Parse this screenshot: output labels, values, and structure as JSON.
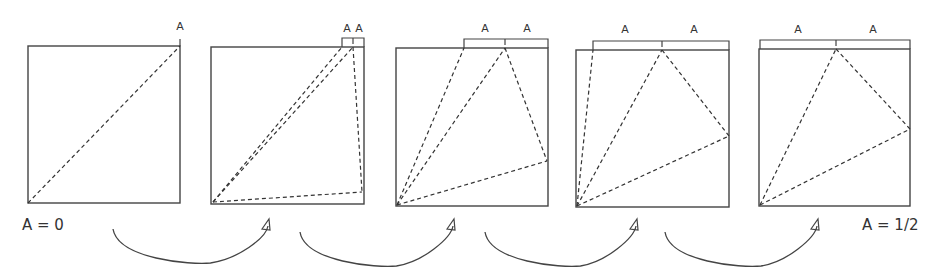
{
  "diagram": {
    "stroke_color": "#444444",
    "dash_color": "#333333",
    "labels": {
      "start": "A = 0",
      "end": "A = 1/2",
      "segment": "A"
    },
    "panels": [
      {
        "box": [
          28,
          46,
          180,
          203
        ],
        "brackets": [],
        "tick_labels": [
          {
            "x": 180,
            "y": 20,
            "text": "A"
          }
        ],
        "dashed_lines": [
          [
            [
              28,
              203
            ],
            [
              180,
              46
            ]
          ]
        ]
      },
      {
        "box": [
          211,
          47,
          364,
          204
        ],
        "brackets": [
          [
            342,
            353,
            364
          ]
        ],
        "tick_labels": [
          {
            "x": 347,
            "y": 22,
            "text": "A"
          },
          {
            "x": 359,
            "y": 22,
            "text": "A"
          }
        ],
        "dashed_lines": [
          [
            [
              213,
              202
            ],
            [
              342,
              47
            ]
          ],
          [
            [
              213,
              202
            ],
            [
              353,
              47
            ]
          ],
          [
            [
              353,
              47
            ],
            [
              362,
              192
            ]
          ],
          [
            [
              213,
              202
            ],
            [
              362,
              192
            ]
          ]
        ]
      },
      {
        "box": [
          396,
          48,
          548,
          206
        ],
        "brackets": [
          [
            464,
            505,
            548
          ]
        ],
        "tick_labels": [
          {
            "x": 485,
            "y": 22,
            "text": "A"
          },
          {
            "x": 527,
            "y": 22,
            "text": "A"
          }
        ],
        "dashed_lines": [
          [
            [
              397,
              205
            ],
            [
              464,
              48
            ]
          ],
          [
            [
              397,
              205
            ],
            [
              505,
              48
            ]
          ],
          [
            [
              505,
              48
            ],
            [
              547,
              161
            ]
          ],
          [
            [
              397,
              205
            ],
            [
              547,
              161
            ]
          ]
        ]
      },
      {
        "box": [
          576,
          50,
          729,
          207
        ],
        "brackets": [
          [
            593,
            662,
            729
          ]
        ],
        "tick_labels": [
          {
            "x": 625,
            "y": 23,
            "text": "A"
          },
          {
            "x": 694,
            "y": 23,
            "text": "A"
          }
        ],
        "dashed_lines": [
          [
            [
              577,
              206
            ],
            [
              593,
              50
            ]
          ],
          [
            [
              577,
              206
            ],
            [
              662,
              50
            ]
          ],
          [
            [
              662,
              50
            ],
            [
              729,
              136
            ]
          ],
          [
            [
              577,
              206
            ],
            [
              729,
              136
            ]
          ]
        ]
      },
      {
        "box": [
          759,
          49,
          910,
          206
        ],
        "brackets": [
          [
            760,
            836,
            910
          ]
        ],
        "tick_labels": [
          {
            "x": 798,
            "y": 23,
            "text": "A"
          },
          {
            "x": 873,
            "y": 23,
            "text": "A"
          }
        ],
        "dashed_lines": [
          [
            [
              760,
              205
            ],
            [
              836,
              49
            ]
          ],
          [
            [
              836,
              49
            ],
            [
              910,
              129
            ]
          ],
          [
            [
              760,
              205
            ],
            [
              910,
              129
            ]
          ]
        ]
      }
    ],
    "arrows": [
      {
        "from": [
          113,
          229
        ],
        "to": [
          268,
          228
        ]
      },
      {
        "from": [
          300,
          232
        ],
        "to": [
          453,
          228
        ]
      },
      {
        "from": [
          485,
          232
        ],
        "to": [
          636,
          228
        ]
      },
      {
        "from": [
          665,
          232
        ],
        "to": [
          817,
          228
        ]
      }
    ]
  }
}
